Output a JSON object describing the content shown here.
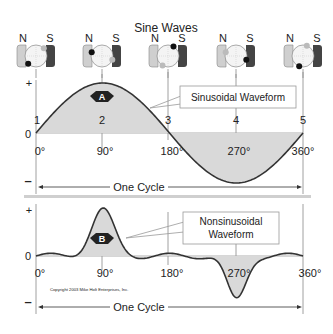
{
  "title": "Sine Waves",
  "generators": [
    {
      "n_label": "N",
      "s_label": "S",
      "point": "1",
      "dot_angle": 135
    },
    {
      "n_label": "N",
      "s_label": "S",
      "point": "2",
      "dot_angle": 200
    },
    {
      "n_label": "N",
      "s_label": "S",
      "point": "3",
      "dot_angle": 300
    },
    {
      "n_label": "N",
      "s_label": "S",
      "point": "4",
      "dot_angle": 20
    },
    {
      "n_label": "N",
      "s_label": "S",
      "point": "5",
      "dot_angle": 110
    }
  ],
  "top_chart": {
    "plus_label": "+",
    "zero_label": "0",
    "minus_label": "–",
    "badge": "A",
    "callout": "Sinusoidal Waveform",
    "point_labels": [
      "1",
      "2",
      "3",
      "4",
      "5"
    ],
    "degree_labels": [
      "0°",
      "90°",
      "180°",
      "270°",
      "360°"
    ],
    "cycle_label": "One Cycle"
  },
  "bottom_chart": {
    "plus_label": "+",
    "zero_label": "0",
    "minus_label": "–",
    "badge": "B",
    "callout_line1": "Nonsinusoidal",
    "callout_line2": "Waveform",
    "degree_labels": [
      "0°",
      "90°",
      "180°",
      "270°",
      "360°"
    ],
    "cycle_label": "One Cycle",
    "copyright": "Copyright 2003  Mike Holt Enterprises, Inc."
  },
  "colors": {
    "fill": "#d9d9d9",
    "stroke": "#333333",
    "divider": "#cfcfcf",
    "badge": "#222222"
  }
}
